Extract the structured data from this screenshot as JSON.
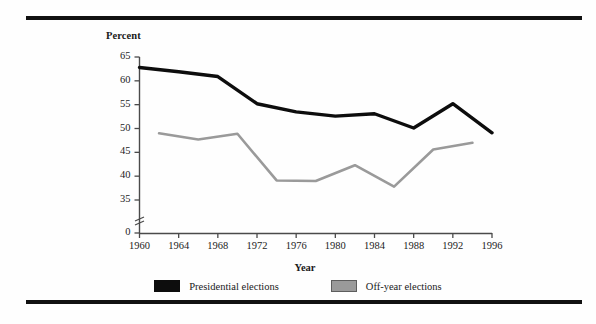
{
  "figure": {
    "background_color": "#fefefe",
    "rule_color": "#111111"
  },
  "chart_data": {
    "type": "line",
    "title": "",
    "subtitle": "",
    "xlabel": "Year",
    "ylabel": "Percent",
    "xlim": [
      1960,
      1996
    ],
    "ylim": [
      35,
      65
    ],
    "y_axis_break": true,
    "y_axis_break_note": "axis broken between 0 and 35",
    "grid": false,
    "legend_position": "bottom-center",
    "x_ticks": [
      1960,
      1964,
      1968,
      1972,
      1976,
      1980,
      1984,
      1988,
      1992,
      1996
    ],
    "y_ticks": [
      0,
      35,
      40,
      45,
      50,
      55,
      60,
      65
    ],
    "series": [
      {
        "name": "Presidential elections",
        "color": "#0d0d0d",
        "x": [
          1960,
          1964,
          1968,
          1972,
          1976,
          1980,
          1984,
          1988,
          1992,
          1996
        ],
        "values": [
          62.8,
          61.9,
          60.9,
          55.2,
          53.5,
          52.6,
          53.1,
          50.1,
          55.2,
          49.1
        ]
      },
      {
        "name": "Off-year elections",
        "color": "#9a9a9a",
        "x": [
          1962,
          1966,
          1970,
          1974,
          1978,
          1982,
          1986,
          1990,
          1994
        ],
        "values": [
          49.0,
          47.7,
          48.9,
          39.1,
          39.0,
          42.3,
          37.8,
          45.6,
          47.0
        ]
      }
    ]
  },
  "axis": {
    "y_title": "Percent",
    "x_title": "Year",
    "y_tick_labels": [
      "65",
      "60",
      "55",
      "50",
      "45",
      "40",
      "35",
      "0"
    ],
    "x_tick_labels": [
      "1960",
      "1964",
      "1968",
      "1972",
      "1976",
      "1980",
      "1984",
      "1988",
      "1992",
      "1996"
    ]
  },
  "legend": {
    "items": [
      {
        "label": "Presidential elections",
        "color": "#0d0d0d",
        "style": "solid-fill"
      },
      {
        "label": "Off-year elections",
        "color": "#9a9a9a",
        "style": "outlined-fill"
      }
    ]
  }
}
